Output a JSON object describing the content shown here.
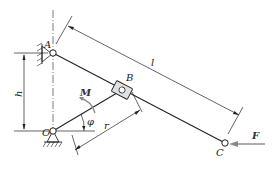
{
  "diagram": {
    "type": "mechanism",
    "points": {
      "A": {
        "label": "A",
        "kind": "fixed-pivot"
      },
      "O": {
        "label": "O",
        "kind": "fixed-pivot"
      },
      "B": {
        "label": "B",
        "kind": "slider"
      },
      "C": {
        "label": "C",
        "kind": "end-point"
      }
    },
    "dimensions": {
      "h": "h",
      "l": "l",
      "r": "r",
      "angle": "φ"
    },
    "loads": {
      "moment": "M",
      "force": "F"
    },
    "colors": {
      "line": "#222222",
      "load": "#8a8a8a"
    }
  }
}
